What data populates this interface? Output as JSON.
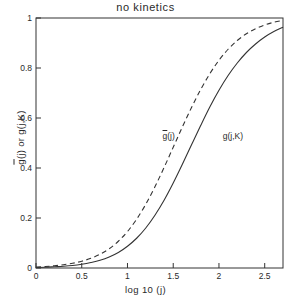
{
  "chart_data": {
    "type": "line",
    "title": "no kinetics",
    "xlabel": "log 10 (j)",
    "ylabel": "ḡ(j) or g(j,K)",
    "ylabel_part1": "g",
    "ylabel_part2": "(j) or g(j,K)",
    "xlim": [
      0,
      2.7
    ],
    "ylim": [
      0,
      1
    ],
    "grid": false,
    "legend_position": "inline-annotations",
    "xticks": [
      0,
      0.5,
      1,
      1.5,
      2,
      2.5
    ],
    "xticklabels": [
      "0",
      "0.5",
      "1",
      "1.5",
      "2",
      "2.5"
    ],
    "yticks": [
      0,
      0.2,
      0.4,
      0.6,
      0.8,
      1
    ],
    "yticklabels": [
      "0",
      "0.2",
      "0.4",
      "0.6",
      "0.8",
      "1"
    ],
    "annotations": [
      {
        "name": "gbar-curve-label",
        "text": "ḡ(j)",
        "text_main": "(j)",
        "text_bar": "g",
        "x": 1.58,
        "y": 0.525
      },
      {
        "name": "gjk-curve-label",
        "text": "g(j,K)",
        "x": 2.02,
        "y": 0.525
      }
    ],
    "series": [
      {
        "name": "ḡ(j)",
        "style": "dashed",
        "color": "#333333",
        "x": [
          0.0,
          0.1,
          0.2,
          0.3,
          0.4,
          0.5,
          0.6,
          0.7,
          0.8,
          0.9,
          1.0,
          1.1,
          1.2,
          1.3,
          1.4,
          1.5,
          1.6,
          1.7,
          1.8,
          1.9,
          2.0,
          2.1,
          2.2,
          2.3,
          2.4,
          2.5,
          2.6,
          2.7
        ],
        "values": [
          0.004,
          0.006,
          0.009,
          0.013,
          0.019,
          0.027,
          0.039,
          0.055,
          0.077,
          0.107,
          0.146,
          0.195,
          0.255,
          0.325,
          0.402,
          0.483,
          0.564,
          0.642,
          0.714,
          0.777,
          0.831,
          0.875,
          0.91,
          0.937,
          0.957,
          0.972,
          0.983,
          0.991
        ]
      },
      {
        "name": "g(j,K)",
        "style": "solid",
        "color": "#333333",
        "x": [
          0.0,
          0.1,
          0.2,
          0.3,
          0.4,
          0.5,
          0.6,
          0.7,
          0.8,
          0.9,
          1.0,
          1.1,
          1.2,
          1.3,
          1.4,
          1.5,
          1.6,
          1.7,
          1.8,
          1.9,
          2.0,
          2.1,
          2.2,
          2.3,
          2.4,
          2.5,
          2.6,
          2.7
        ],
        "values": [
          0.002,
          0.003,
          0.005,
          0.007,
          0.01,
          0.015,
          0.022,
          0.031,
          0.044,
          0.062,
          0.087,
          0.119,
          0.16,
          0.211,
          0.271,
          0.34,
          0.415,
          0.493,
          0.57,
          0.644,
          0.711,
          0.77,
          0.82,
          0.862,
          0.896,
          0.924,
          0.946,
          0.963
        ]
      }
    ]
  }
}
